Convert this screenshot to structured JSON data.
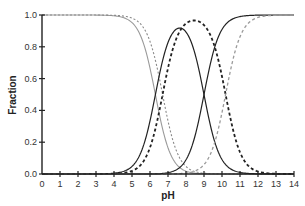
{
  "chart_data": {
    "type": "line",
    "title": "",
    "xlabel": "pH",
    "ylabel": "Fraction",
    "xlim": [
      0,
      14
    ],
    "ylim": [
      0.0,
      1.0
    ],
    "xticks": [
      "0",
      "1",
      "2",
      "3",
      "4",
      "5",
      "6",
      "7",
      "8",
      "9",
      "10",
      "11",
      "12",
      "13",
      "14"
    ],
    "yticks": [
      "0.0",
      "0.2",
      "0.4",
      "0.6",
      "0.8",
      "1.0"
    ],
    "grid": false,
    "legend": null,
    "systems": [
      {
        "name": "System A",
        "pKa1": 6.3,
        "pKa2": 9.0,
        "color": "#222222"
      },
      {
        "name": "System B",
        "pKa1": 6.7,
        "pKa2": 10.2,
        "color": "#444444"
      }
    ],
    "series": [
      {
        "name": "System A – fully protonated (H2A)",
        "style": "solid",
        "color": "#999999",
        "shape": "decreasing sigmoid",
        "midpoint_pH": 6.3
      },
      {
        "name": "System B – fully protonated (H2B)",
        "style": "dotted",
        "color": "#888888",
        "shape": "decreasing sigmoid",
        "midpoint_pH": 6.7
      },
      {
        "name": "System A – intermediate (HA-)",
        "style": "solid",
        "color": "#222222",
        "shape": "bell",
        "peak_pH": 7.65,
        "peak_value": 0.95
      },
      {
        "name": "System B – intermediate (HB-)",
        "style": "dashed-bold",
        "color": "#222222",
        "shape": "bell",
        "peak_pH": 8.45,
        "peak_value": 0.97
      },
      {
        "name": "System A – fully deprotonated (A2-)",
        "style": "solid",
        "color": "#222222",
        "shape": "increasing sigmoid",
        "midpoint_pH": 9.0
      },
      {
        "name": "System B – fully deprotonated (B2-)",
        "style": "dashed",
        "color": "#999999",
        "shape": "increasing sigmoid",
        "midpoint_pH": 10.2
      }
    ]
  }
}
